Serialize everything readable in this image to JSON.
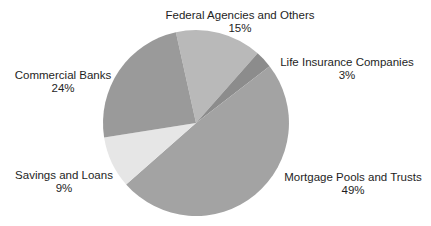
{
  "chart_data": {
    "type": "pie",
    "title": "",
    "categories": [
      "Federal Agencies and Others",
      "Life Insurance Companies",
      "Mortgage Pools and Trusts",
      "Savings and Loans",
      "Commercial Banks"
    ],
    "values": [
      15,
      3,
      49,
      9,
      24
    ],
    "value_labels": [
      "15%",
      "3%",
      "49%",
      "9%",
      "24%"
    ],
    "colors": [
      "#b9b9b9",
      "#8c8c8c",
      "#a3a3a3",
      "#e6e6e6",
      "#9a9a9a"
    ],
    "legend": "none (direct labels)",
    "center": [
      196,
      123
    ],
    "radius": 93,
    "start_angle_deg": -102.5,
    "direction": "clockwise"
  },
  "labels": {
    "federal": {
      "name": "Federal Agencies and Others",
      "pct": "15%"
    },
    "life": {
      "name": "Life Insurance Companies",
      "pct": "3%"
    },
    "mortgage": {
      "name": "Mortgage Pools and Trusts",
      "pct": "49%"
    },
    "savings": {
      "name": "Savings and Loans",
      "pct": "9%"
    },
    "commercial": {
      "name": "Commercial Banks",
      "pct": "24%"
    }
  }
}
